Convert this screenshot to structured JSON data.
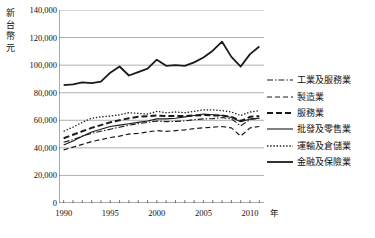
{
  "chart_data": {
    "type": "line",
    "title": "",
    "ylabel": "新台幣元",
    "xlabel": "年",
    "ylim": [
      0,
      140000
    ],
    "xlim": [
      1989.5,
      2011.5
    ],
    "grid": true,
    "legend_position": "right",
    "ytick_labels": [
      "140,000",
      "120,000",
      "100,000",
      "80,000",
      "60,000",
      "40,000",
      "20,000",
      "0"
    ],
    "ytick_values": [
      140000,
      120000,
      100000,
      80000,
      60000,
      40000,
      20000,
      0
    ],
    "xtick_labels": [
      "1990",
      "1995",
      "2000",
      "2005",
      "2010"
    ],
    "xtick_values": [
      1990,
      1995,
      2000,
      2005,
      2010
    ],
    "x": [
      1990,
      1991,
      1992,
      1993,
      1994,
      1995,
      1996,
      1997,
      1998,
      1999,
      2000,
      2001,
      2002,
      2003,
      2004,
      2005,
      2006,
      2007,
      2008,
      2009,
      2010,
      2011
    ],
    "series": [
      {
        "name": "工業及服務業",
        "style": "dash-dot",
        "values": [
          44000,
          46000,
          48500,
          50500,
          52000,
          53500,
          55000,
          56500,
          57500,
          58500,
          59500,
          59000,
          59200,
          59500,
          60500,
          61000,
          61200,
          62000,
          61000,
          56000,
          60500,
          61500
        ]
      },
      {
        "name": "製造業",
        "style": "dashed",
        "values": [
          38500,
          40500,
          42500,
          44500,
          46000,
          47500,
          48500,
          50000,
          50500,
          51500,
          52500,
          52000,
          52500,
          53000,
          54000,
          54500,
          55000,
          55500,
          54500,
          48500,
          54500,
          55500
        ]
      },
      {
        "name": "服務業",
        "style": "dashed-thick",
        "values": [
          47000,
          49500,
          52000,
          54500,
          56500,
          58500,
          60000,
          61500,
          62500,
          63000,
          63500,
          63000,
          63200,
          63000,
          63500,
          63800,
          63500,
          63500,
          62500,
          59500,
          62500,
          63000
        ]
      },
      {
        "name": "批發及零售業",
        "style": "solid-thin",
        "values": [
          42000,
          45000,
          48500,
          51500,
          53500,
          55500,
          56500,
          57500,
          58500,
          59500,
          61000,
          61000,
          61500,
          62500,
          63500,
          64500,
          64000,
          63500,
          62000,
          59000,
          61000,
          61500
        ]
      },
      {
        "name": "運輸及倉儲業",
        "style": "dotted",
        "values": [
          52000,
          55000,
          58500,
          61500,
          62500,
          63000,
          64000,
          65500,
          65000,
          64500,
          66500,
          65500,
          66000,
          65500,
          66500,
          67500,
          67500,
          67000,
          66000,
          63500,
          66000,
          67000
        ]
      },
      {
        "name": "金融及保險業",
        "style": "solid-thick",
        "values": [
          85500,
          86000,
          87500,
          87000,
          88000,
          94500,
          99000,
          92500,
          95000,
          97500,
          104000,
          99500,
          100000,
          99500,
          102000,
          105500,
          110500,
          117000,
          106000,
          99000,
          108000,
          113500
        ]
      }
    ]
  },
  "axis": {
    "ylabel_chars": [
      "新",
      "台",
      "幣",
      "元"
    ],
    "xlabel": "年"
  }
}
